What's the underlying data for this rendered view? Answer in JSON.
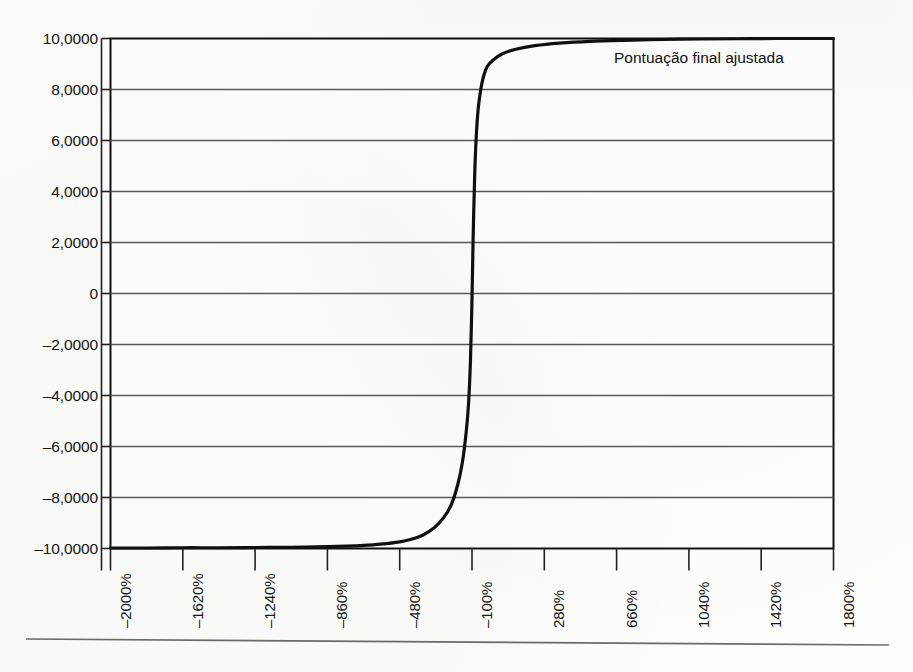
{
  "chart_data": {
    "type": "line",
    "title": "",
    "subtitle": "",
    "xlabel": "",
    "ylabel": "",
    "legend_position": "inside-top-right",
    "grid": true,
    "series_label": "Pontuação final ajustada",
    "x_tick_labels": [
      "-2000%",
      "-1620%",
      "-1240%",
      "-860%",
      "-480%",
      "-100%",
      "280%",
      "660%",
      "1040%",
      "1420%",
      "1800%"
    ],
    "x_tick_values": [
      -2000,
      -1620,
      -1240,
      -860,
      -480,
      -100,
      280,
      660,
      1040,
      1420,
      1800
    ],
    "y_tick_labels": [
      "10,0000",
      "8,0000",
      "6,0000",
      "4,0000",
      "2,0000",
      "0",
      "-2,0000",
      "-4,0000",
      "-6,0000",
      "-8,0000",
      "-10,0000"
    ],
    "y_tick_values": [
      10,
      8,
      6,
      4,
      2,
      0,
      -2,
      -4,
      -6,
      -8,
      -10
    ],
    "xlim": [
      -2000,
      1800
    ],
    "ylim": [
      -10,
      10
    ],
    "series": [
      {
        "name": "Pontuação final ajustada",
        "color": "#101010",
        "x": [
          -2000,
          -1810,
          -1620,
          -1430,
          -1240,
          -1050,
          -860,
          -760,
          -670,
          -580,
          -480,
          -420,
          -360,
          -300,
          -250,
          -210,
          -175,
          -150,
          -130,
          -118,
          -108,
          -100,
          -94,
          -86,
          -78,
          -68,
          -56,
          -40,
          -20,
          10,
          60,
          130,
          230,
          360,
          520,
          700,
          900,
          1100,
          1300,
          1500,
          1800
        ],
        "y": [
          -9.98,
          -9.98,
          -9.97,
          -9.97,
          -9.96,
          -9.95,
          -9.93,
          -9.91,
          -9.88,
          -9.83,
          -9.74,
          -9.64,
          -9.48,
          -9.2,
          -8.8,
          -8.3,
          -7.5,
          -6.6,
          -5.4,
          -4.3,
          -2.6,
          -0.2,
          2.2,
          4.6,
          6.1,
          7.2,
          7.9,
          8.5,
          8.9,
          9.15,
          9.4,
          9.58,
          9.72,
          9.82,
          9.89,
          9.93,
          9.96,
          9.98,
          9.99,
          10.0,
          10.0
        ]
      }
    ]
  },
  "colors": {
    "page_background": "#fdfdfb",
    "curve": "#101010",
    "gridline": "#595959",
    "frame": "#111111",
    "axis_rule": "#6b6b6b",
    "text": "#151515"
  },
  "axis_rule": {
    "present": true,
    "description": "horizontal page rule below x tick labels"
  }
}
